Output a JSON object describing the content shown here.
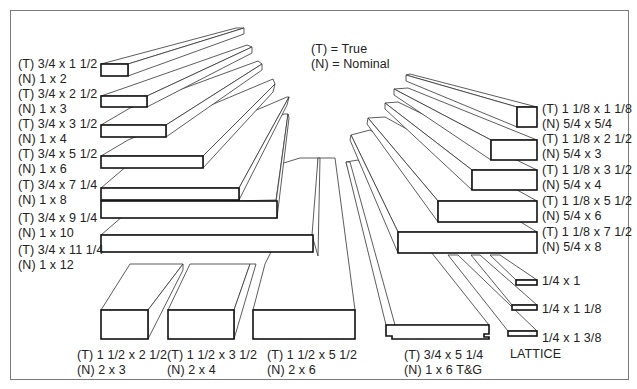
{
  "legend": {
    "true_key": "(T) = True",
    "nominal_key": "(N) = Nominal"
  },
  "boards_1x": [
    {
      "true": "(T) 3/4 x 1 1/2",
      "nominal": "(N) 1 x 2"
    },
    {
      "true": "(T) 3/4 x 2 1/2",
      "nominal": "(N) 1 x 3"
    },
    {
      "true": "(T) 3/4 x 3 1/2",
      "nominal": "(N) 1 x 4"
    },
    {
      "true": "(T) 3/4 x 5 1/2",
      "nominal": "(N) 1 x 6"
    },
    {
      "true": "(T) 3/4 x 7 1/4",
      "nominal": "(N) 1 x 8"
    },
    {
      "true": "(T) 3/4 x 9 1/4",
      "nominal": "(N) 1 x 10"
    },
    {
      "true": "(T) 3/4 x 11 1/4",
      "nominal": "(N) 1 x 12"
    }
  ],
  "boards_2x": [
    {
      "true": "(T) 1 1/2 x 2 1/2",
      "nominal": "(N) 2 x 3"
    },
    {
      "true": "(T) 1 1/2 x 3 1/2",
      "nominal": "(N) 2 x 4"
    },
    {
      "true": "(T) 1 1/2 x 5 1/2",
      "nominal": "(N) 2 x 6"
    }
  ],
  "tongue_groove": {
    "true": "(T) 3/4 x 5 1/4",
    "nominal": "(N) 1 x 6 T&G"
  },
  "boards_5_4": [
    {
      "true": "(T) 1 1/8 x 1 1/8",
      "nominal": "(N) 5/4 x 5/4"
    },
    {
      "true": "(T) 1 1/8 x 2 1/2",
      "nominal": "(N) 5/4 x 3"
    },
    {
      "true": "(T) 1 1/8 x 3 1/2",
      "nominal": "(N) 5/4 x 4"
    },
    {
      "true": "(T) 1 1/8 x 5 1/2",
      "nominal": "(N) 5/4 x 6"
    },
    {
      "true": "(T) 1 1/8 x 7 1/2",
      "nominal": "(N) 5/4 x 8"
    }
  ],
  "lattice": {
    "title": "LATTICE",
    "sizes": [
      "1/4 x 1",
      "1/4 x 1 1/8",
      "1/4 x 1 3/8"
    ]
  }
}
